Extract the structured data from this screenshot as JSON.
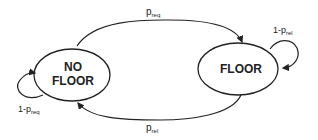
{
  "diagram": {
    "type": "state-transition",
    "states": [
      {
        "id": "no_floor",
        "line1": "NO",
        "line2": "FLOOR"
      },
      {
        "id": "floor",
        "label": "FLOOR"
      }
    ],
    "transitions": [
      {
        "from": "no_floor",
        "to": "floor",
        "base": "p",
        "sub": "req"
      },
      {
        "from": "floor",
        "to": "no_floor",
        "base": "p",
        "sub": "rel"
      },
      {
        "from": "no_floor",
        "to": "no_floor",
        "prefix": "1-p",
        "sub": "req"
      },
      {
        "from": "floor",
        "to": "floor",
        "prefix": "1-p",
        "sub": "rel"
      }
    ]
  }
}
